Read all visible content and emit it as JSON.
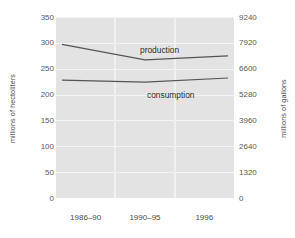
{
  "chart_data": {
    "type": "line",
    "title": "WORLD WINE PRODUCTION AND CONSUMPTION",
    "categories": [
      "1986–90",
      "1990–95",
      "1996"
    ],
    "series": [
      {
        "name": "production",
        "values": [
          297,
          267,
          275
        ]
      },
      {
        "name": "consumption",
        "values": [
          228,
          224,
          232
        ]
      }
    ],
    "xlabel": "",
    "ylabel": "millions of hectoliters",
    "ylabel_right": "millions of gallons",
    "ylim": [
      0,
      350
    ],
    "ylim_right": [
      0,
      9240
    ],
    "yticks": [
      350,
      300,
      250,
      200,
      150,
      100,
      50,
      0
    ],
    "yticks_right": [
      9240,
      7920,
      6600,
      5280,
      3960,
      2640,
      1320,
      0
    ],
    "grid": true,
    "legend": "inline-labels",
    "line_color": "#555555",
    "plot_background": "#e3e3e3",
    "gridline_color": "#f4f4f4"
  },
  "labels": {
    "production": "production",
    "consumption": "consumption"
  }
}
